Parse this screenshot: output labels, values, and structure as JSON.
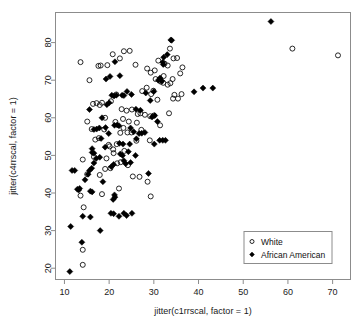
{
  "chart_data": {
    "type": "scatter",
    "title": "",
    "xlabel": "jitter(c1rrscal, factor = 1)",
    "ylabel": "jitter(c4rrscal, factor = 1)",
    "xlim": [
      8,
      74
    ],
    "ylim": [
      17,
      88
    ],
    "xticks": [
      10,
      20,
      30,
      40,
      50,
      60,
      70
    ],
    "yticks": [
      20,
      30,
      40,
      50,
      60,
      70,
      80
    ],
    "grid": false,
    "legend_position": "bottom-right",
    "legend": [
      {
        "name": "White",
        "marker": "open-circle"
      },
      {
        "name": "African American",
        "marker": "filled-diamond"
      }
    ],
    "series": [
      {
        "name": "White",
        "marker": "open-circle",
        "color": "#111111",
        "points": [
          [
            13.6,
            74.8
          ],
          [
            15.6,
            70.0
          ],
          [
            17.6,
            73.8
          ],
          [
            18.1,
            73.9
          ],
          [
            19.6,
            74.0
          ],
          [
            20.8,
            76.9
          ],
          [
            22.4,
            75.8
          ],
          [
            23.3,
            77.7
          ],
          [
            24.6,
            77.8
          ],
          [
            25.9,
            74.1
          ],
          [
            28.5,
            73.1
          ],
          [
            29.3,
            72.0
          ],
          [
            30.2,
            72.6
          ],
          [
            31.0,
            75.2
          ],
          [
            32.4,
            74.4
          ],
          [
            33.6,
            78.4
          ],
          [
            34.4,
            75.8
          ],
          [
            35.2,
            75.9
          ],
          [
            35.9,
            71.8
          ],
          [
            36.4,
            73.4
          ],
          [
            31.6,
            69.6
          ],
          [
            32.1,
            69.3
          ],
          [
            33.1,
            68.8
          ],
          [
            34.6,
            66.1
          ],
          [
            35.4,
            65.1
          ],
          [
            36.2,
            66.3
          ],
          [
            16.4,
            63.7
          ],
          [
            17.2,
            63.9
          ],
          [
            17.9,
            63.4
          ],
          [
            18.4,
            64.0
          ],
          [
            19.1,
            60.0
          ],
          [
            20.4,
            64.4
          ],
          [
            21.6,
            66.2
          ],
          [
            22.8,
            62.3
          ],
          [
            23.9,
            61.9
          ],
          [
            25.1,
            62.2
          ],
          [
            26.4,
            61.0
          ],
          [
            27.4,
            67.1
          ],
          [
            28.4,
            68.0
          ],
          [
            29.4,
            66.3
          ],
          [
            30.4,
            70.3
          ],
          [
            31.3,
            69.9
          ],
          [
            32.2,
            71.1
          ],
          [
            15.1,
            59.0
          ],
          [
            16.1,
            57.0
          ],
          [
            16.9,
            54.2
          ],
          [
            17.7,
            54.6
          ],
          [
            18.9,
            56.9
          ],
          [
            19.9,
            52.8
          ],
          [
            20.9,
            51.6
          ],
          [
            21.7,
            53.0
          ],
          [
            22.5,
            56.0
          ],
          [
            23.2,
            57.3
          ],
          [
            24.1,
            56.1
          ],
          [
            25.0,
            56.1
          ],
          [
            26.1,
            53.9
          ],
          [
            27.0,
            61.2
          ],
          [
            28.0,
            60.8
          ],
          [
            29.2,
            60.4
          ],
          [
            30.0,
            60.6
          ],
          [
            14.1,
            48.9
          ],
          [
            15.1,
            45.0
          ],
          [
            16.6,
            49.6
          ],
          [
            17.9,
            44.8
          ],
          [
            19.1,
            46.4
          ],
          [
            20.1,
            52.4
          ],
          [
            21.0,
            50.6
          ],
          [
            21.8,
            47.9
          ],
          [
            22.6,
            48.2
          ],
          [
            23.4,
            51.2
          ],
          [
            24.2,
            47.4
          ],
          [
            25.3,
            44.4
          ],
          [
            26.8,
            44.3
          ],
          [
            28.6,
            43.0
          ],
          [
            29.3,
            39.1
          ],
          [
            13.6,
            39.3
          ],
          [
            14.3,
            36.2
          ],
          [
            18.4,
            39.7
          ],
          [
            22.2,
            41.2
          ],
          [
            14.1,
            24.9
          ],
          [
            14.1,
            20.9
          ],
          [
            29.1,
            54.0
          ],
          [
            27.2,
            56.8
          ],
          [
            26.2,
            58.7
          ],
          [
            24.4,
            59.0
          ],
          [
            23.1,
            59.7
          ],
          [
            21.4,
            58.9
          ],
          [
            20.3,
            46.6
          ],
          [
            19.4,
            49.2
          ],
          [
            61.0,
            78.4
          ],
          [
            71.2,
            76.6
          ],
          [
            33.4,
            61.2
          ],
          [
            31.4,
            58.0
          ],
          [
            33.1,
            73.9
          ],
          [
            34.2,
            70.3
          ],
          [
            33.7,
            69.2
          ],
          [
            29.9,
            67.2
          ],
          [
            30.8,
            64.8
          ],
          [
            34.3,
            65.1
          ]
        ]
      },
      {
        "name": "African American",
        "marker": "filled-diamond",
        "color": "#000000",
        "points": [
          [
            11.2,
            19.1
          ],
          [
            11.4,
            31.1
          ],
          [
            13.9,
            26.9
          ],
          [
            14.1,
            33.8
          ],
          [
            15.8,
            33.6
          ],
          [
            18.0,
            30.0
          ],
          [
            20.4,
            34.6
          ],
          [
            21.0,
            34.5
          ],
          [
            22.2,
            33.8
          ],
          [
            23.3,
            34.6
          ],
          [
            23.9,
            34.0
          ],
          [
            25.1,
            34.6
          ],
          [
            12.9,
            41.0
          ],
          [
            13.2,
            40.8
          ],
          [
            13.4,
            41.2
          ],
          [
            15.8,
            40.5
          ],
          [
            16.2,
            40.3
          ],
          [
            20.9,
            38.3
          ],
          [
            21.2,
            39.5
          ],
          [
            21.3,
            38.9
          ],
          [
            11.7,
            46.0
          ],
          [
            12.3,
            46.0
          ],
          [
            15.3,
            45.0
          ],
          [
            15.6,
            46.0
          ],
          [
            16.1,
            46.6
          ],
          [
            16.6,
            48.0
          ],
          [
            17.1,
            49.2
          ],
          [
            17.9,
            49.5
          ],
          [
            14.6,
            43.5
          ],
          [
            16.2,
            50.8
          ],
          [
            16.6,
            50.6
          ],
          [
            16.2,
            51.8
          ],
          [
            22.5,
            50.4
          ],
          [
            23.0,
            50.0
          ],
          [
            23.3,
            48.6
          ],
          [
            23.7,
            47.8
          ],
          [
            20.5,
            47.0
          ],
          [
            21.0,
            47.6
          ],
          [
            22.3,
            53.2
          ],
          [
            23.1,
            53.0
          ],
          [
            24.6,
            53.0
          ],
          [
            26.1,
            54.4
          ],
          [
            26.7,
            55.8
          ],
          [
            27.3,
            55.9
          ],
          [
            28.0,
            56.1
          ],
          [
            28.8,
            45.2
          ],
          [
            30.1,
            53.0
          ],
          [
            31.3,
            54.0
          ],
          [
            32.0,
            54.0
          ],
          [
            32.6,
            54.0
          ],
          [
            21.2,
            58.0
          ],
          [
            21.8,
            58.1
          ],
          [
            22.2,
            57.9
          ],
          [
            19.9,
            55.8
          ],
          [
            19.1,
            52.2
          ],
          [
            18.2,
            54.5
          ],
          [
            17.2,
            57.0
          ],
          [
            16.6,
            56.9
          ],
          [
            17.8,
            57.3
          ],
          [
            19.2,
            57.4
          ],
          [
            15.6,
            62.2
          ],
          [
            18.4,
            60.0
          ],
          [
            19.5,
            63.5
          ],
          [
            20.0,
            64.0
          ],
          [
            20.6,
            66.0
          ],
          [
            21.1,
            65.8
          ],
          [
            21.6,
            66.0
          ],
          [
            22.9,
            66.0
          ],
          [
            23.3,
            65.9
          ],
          [
            20.2,
            71.0
          ],
          [
            21.3,
            74.9
          ],
          [
            22.4,
            71.2
          ],
          [
            19.3,
            70.3
          ],
          [
            24.0,
            67.0
          ],
          [
            25.0,
            66.2
          ],
          [
            26.0,
            62.3
          ],
          [
            27.0,
            62.0
          ],
          [
            28.2,
            66.6
          ],
          [
            29.2,
            64.6
          ],
          [
            30.0,
            67.0
          ],
          [
            31.0,
            70.0
          ],
          [
            31.4,
            70.6
          ],
          [
            31.8,
            69.8
          ],
          [
            32.2,
            76.1
          ],
          [
            32.0,
            74.8
          ],
          [
            32.1,
            74.2
          ],
          [
            33.0,
            76.8
          ],
          [
            33.8,
            80.7
          ],
          [
            34.0,
            80.6
          ],
          [
            39.0,
            66.9
          ],
          [
            41.0,
            67.9
          ],
          [
            43.2,
            67.9
          ],
          [
            56.2,
            85.6
          ],
          [
            30.2,
            60.6
          ],
          [
            30.8,
            59.0
          ],
          [
            29.6,
            60.2
          ],
          [
            24.8,
            57.3
          ],
          [
            25.5,
            56.3
          ],
          [
            25.9,
            50.0
          ],
          [
            24.3,
            51.0
          ],
          [
            18.6,
            43.0
          ],
          [
            24.8,
            48.1
          ]
        ]
      }
    ]
  }
}
